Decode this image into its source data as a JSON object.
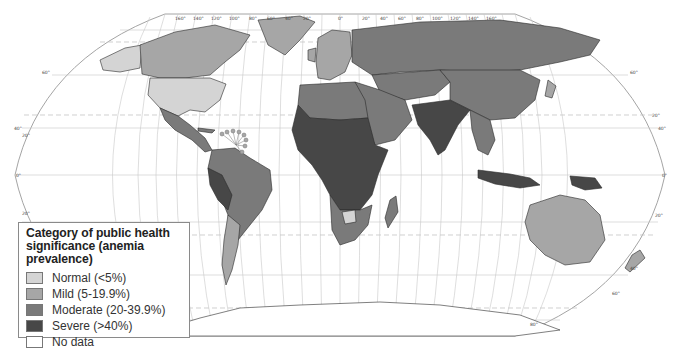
{
  "map": {
    "title": "Worldwide prevalence of anemia by country",
    "projection": "Robinson",
    "longitude_labels_top": [
      "160°",
      "140°",
      "120°",
      "100°",
      "80°",
      "60°",
      "40°",
      "20°",
      "0°",
      "20°",
      "40°",
      "60°",
      "80°",
      "100°",
      "120°",
      "140°",
      "160°"
    ],
    "latitude_labels": [
      "80°",
      "60°",
      "40°",
      "20°",
      "0°",
      "20°",
      "40°",
      "60°",
      "80°"
    ],
    "colors": {
      "normal": "#d4d4d4",
      "mild": "#a6a6a6",
      "moderate": "#7a7a7a",
      "severe": "#474747",
      "no_data": "#ffffff",
      "graticule": "#c8c8c8"
    },
    "regions": [
      {
        "name": "Alaska / USA",
        "category": "normal"
      },
      {
        "name": "Canada",
        "category": "mild"
      },
      {
        "name": "Greenland",
        "category": "mild"
      },
      {
        "name": "United States",
        "category": "normal"
      },
      {
        "name": "Mexico",
        "category": "moderate"
      },
      {
        "name": "Central America",
        "category": "moderate"
      },
      {
        "name": "South America (north)",
        "category": "moderate"
      },
      {
        "name": "Brazil",
        "category": "moderate"
      },
      {
        "name": "Peru / Bolivia",
        "category": "severe"
      },
      {
        "name": "Argentina",
        "category": "mild"
      },
      {
        "name": "Chile",
        "category": "mild"
      },
      {
        "name": "Western Europe",
        "category": "mild"
      },
      {
        "name": "Eastern Europe",
        "category": "moderate"
      },
      {
        "name": "Russia",
        "category": "moderate"
      },
      {
        "name": "Central Asia",
        "category": "moderate"
      },
      {
        "name": "China",
        "category": "moderate"
      },
      {
        "name": "Middle East",
        "category": "moderate"
      },
      {
        "name": "North Africa",
        "category": "moderate"
      },
      {
        "name": "Sub-Saharan Africa",
        "category": "severe"
      },
      {
        "name": "Southern Africa",
        "category": "moderate"
      },
      {
        "name": "Botswana",
        "category": "normal"
      },
      {
        "name": "Madagascar",
        "category": "moderate"
      },
      {
        "name": "India / South Asia",
        "category": "severe"
      },
      {
        "name": "Southeast Asia",
        "category": "moderate"
      },
      {
        "name": "Indonesia / PNG",
        "category": "severe"
      },
      {
        "name": "Japan",
        "category": "mild"
      },
      {
        "name": "Australia",
        "category": "mild"
      },
      {
        "name": "New Zealand",
        "category": "mild"
      },
      {
        "name": "Antarctica",
        "category": "no_data"
      }
    ]
  },
  "legend": {
    "title_line1": "Category of public health",
    "title_line2": "significance (anemia prevalence)",
    "items": [
      {
        "key": "normal",
        "label": "Normal (<5%)",
        "color": "#d4d4d4"
      },
      {
        "key": "mild",
        "label": "Mild (5-19.9%)",
        "color": "#a6a6a6"
      },
      {
        "key": "moderate",
        "label": "Moderate (20-39.9%)",
        "color": "#7a7a7a"
      },
      {
        "key": "severe",
        "label": "Severe (>40%)",
        "color": "#474747"
      },
      {
        "key": "no_data",
        "label": "No data",
        "color": "#ffffff"
      }
    ]
  }
}
